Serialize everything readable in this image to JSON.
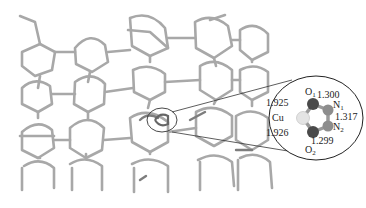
{
  "figure": {
    "framework_color": "#9a9a9a",
    "inset": {
      "atoms": {
        "cu": "Cu",
        "o1": "O",
        "o1_sub": "1",
        "o2": "O",
        "o2_sub": "2",
        "n1": "N",
        "n1_sub": "1",
        "n2": "N",
        "n2_sub": "2"
      },
      "bond_lengths": {
        "cu_o1": "1.925",
        "cu_o2": "1.926",
        "o1_n1": "1.300",
        "n1_n2": "1.317",
        "n2_o2": "1.299"
      },
      "colors": {
        "cu": "#e6e6e6",
        "o": "#4a4a4a",
        "n": "#8a8a8a"
      }
    }
  }
}
